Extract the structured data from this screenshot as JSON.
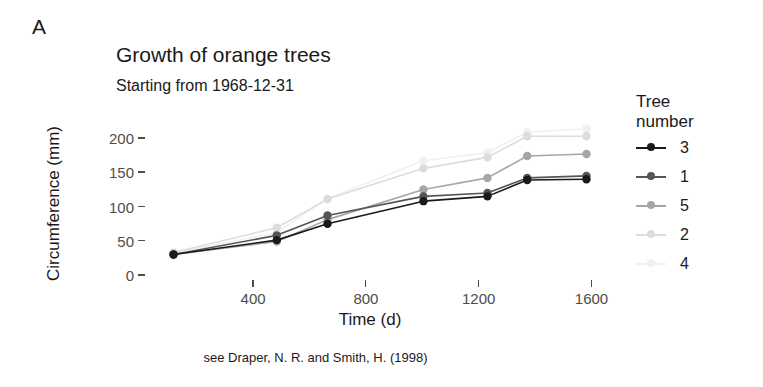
{
  "panel": {
    "label": "A"
  },
  "titles": {
    "title": "Growth of orange trees",
    "subtitle": "Starting from 1968-12-31",
    "caption": "see Draper, N. R. and Smith, H. (1998)"
  },
  "legend": {
    "title_line1": "Tree",
    "title_line2": "number",
    "entries": [
      {
        "label": "3",
        "color": "#1a1a1a"
      },
      {
        "label": "1",
        "color": "#555555"
      },
      {
        "label": "5",
        "color": "#a6a6a6"
      },
      {
        "label": "2",
        "color": "#dcdcdc"
      },
      {
        "label": "4",
        "color": "#f0f0f0"
      }
    ]
  },
  "chart_data": {
    "type": "line",
    "title": "Growth of orange trees",
    "subtitle": "Starting from 1968-12-31",
    "caption": "see Draper, N. R. and Smith, H. (1998)",
    "xlabel": "Time (d)",
    "ylabel": "Circumference (mm)",
    "x": [
      118,
      484,
      664,
      1004,
      1231,
      1372,
      1582
    ],
    "xlim": [
      70,
      1630
    ],
    "ylim": [
      0,
      215
    ],
    "xticks": [
      400,
      800,
      1200,
      1600
    ],
    "xtick_labels": [
      "400",
      "800",
      "1200",
      "1600"
    ],
    "yticks": [
      0,
      50,
      100,
      150,
      200
    ],
    "ytick_labels": [
      "0",
      "50",
      "100",
      "150",
      "200"
    ],
    "grid": false,
    "legend_title": "Tree number",
    "legend_position": "right",
    "markers": "circle",
    "series": [
      {
        "name": "3",
        "color": "#1a1a1a",
        "values": [
          30,
          51,
          75,
          108,
          115,
          139,
          140
        ]
      },
      {
        "name": "1",
        "color": "#555555",
        "values": [
          30,
          58,
          87,
          115,
          120,
          142,
          145
        ]
      },
      {
        "name": "5",
        "color": "#a6a6a6",
        "values": [
          30,
          49,
          81,
          125,
          142,
          174,
          177
        ]
      },
      {
        "name": "2",
        "color": "#dcdcdc",
        "values": [
          33,
          69,
          111,
          156,
          172,
          203,
          203
        ]
      },
      {
        "name": "4",
        "color": "#f0f0f0",
        "values": [
          32,
          62,
          112,
          167,
          179,
          209,
          214
        ]
      }
    ]
  }
}
